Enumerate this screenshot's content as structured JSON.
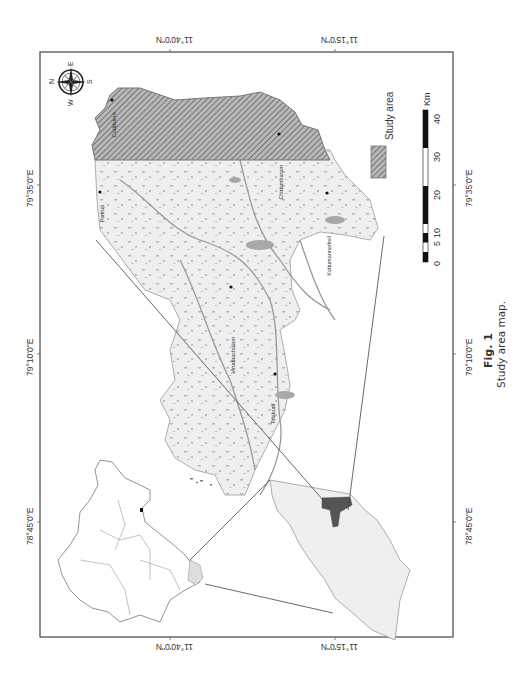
{
  "figure": {
    "caption_label": "Fig. 1",
    "caption_text": "Study area map.",
    "orientation": "rotated 90° counter-clockwise"
  },
  "axes": {
    "latitude_ticks": [
      "11°40'0\"N",
      "11°15'0\"N"
    ],
    "longitude_ticks": [
      "78°45'0\"E",
      "79°10'0\"E",
      "79°35'0\"E"
    ]
  },
  "legend": {
    "items": [
      {
        "label": "Study area",
        "pattern": "diagonal-hatch",
        "color": "#888888"
      }
    ]
  },
  "scale_bar": {
    "unit": "Km",
    "ticks": [
      "0",
      "5",
      "10",
      "20",
      "30",
      "40"
    ]
  },
  "compass": {
    "labels": {
      "north": "N",
      "east": "E",
      "south": "S",
      "west": "W"
    }
  },
  "towns": [
    {
      "name": "Cuddalore"
    },
    {
      "name": "Panruti"
    },
    {
      "name": "Chidambaram"
    },
    {
      "name": "Kattumannarkoil"
    },
    {
      "name": "Virudhachalam"
    },
    {
      "name": "Tittakudi"
    }
  ],
  "colors": {
    "frame": "#444444",
    "land_fill": "#eeeeee",
    "study_area_fill": "#9a9a9a",
    "water": "#aaaaaa",
    "highlight_district": "#555555"
  }
}
